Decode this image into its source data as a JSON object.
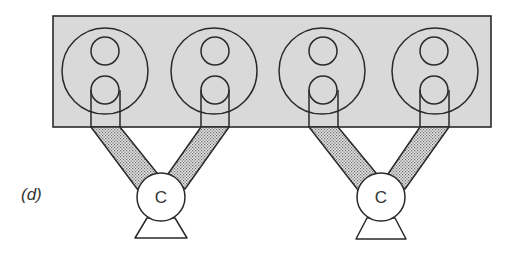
{
  "figure": {
    "panel_label": "(d)",
    "colors": {
      "block_fill": "#d9d9d9",
      "stroke": "#2a2a2a",
      "duct_fill": "#bdbdbd",
      "background": "#ffffff"
    },
    "block": {
      "x": 53,
      "y": 16,
      "width": 438,
      "height": 111
    },
    "cylinders": [
      {
        "id": 1,
        "cx": 105,
        "cy": 71,
        "r": 43
      },
      {
        "id": 2,
        "cx": 214,
        "cy": 71,
        "r": 43
      },
      {
        "id": 3,
        "cx": 322,
        "cy": 71,
        "r": 43
      },
      {
        "id": 4,
        "cx": 435,
        "cy": 71,
        "r": 43
      }
    ],
    "components": [
      {
        "label": "C",
        "cx": 161,
        "cy": 197,
        "r": 24
      },
      {
        "label": "C",
        "cx": 381,
        "cy": 197,
        "r": 24
      }
    ]
  }
}
